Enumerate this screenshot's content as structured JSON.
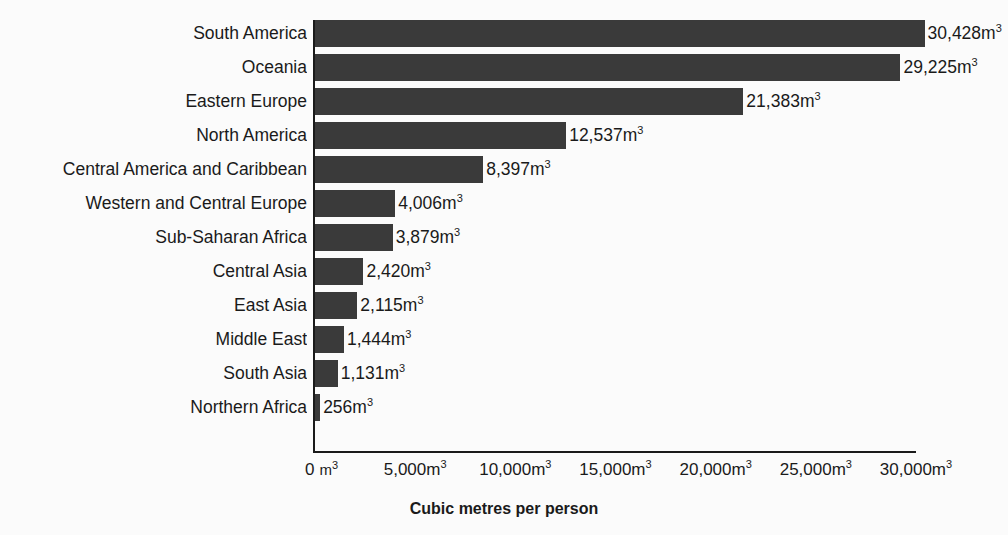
{
  "chart_data": {
    "type": "bar",
    "orientation": "horizontal",
    "title": "",
    "title_note": "chart title is cropped off the top edge of the screenshot and is not legible",
    "xlabel": "Cubic metres per person",
    "ylabel": "",
    "unit_suffix": "m",
    "unit_exponent": "3",
    "categories": [
      "South America",
      "Oceania",
      "Eastern Europe",
      "North America",
      "Central America and Caribbean",
      "Western and Central Europe",
      "Sub-Saharan Africa",
      "Central Asia",
      "East Asia",
      "Middle East",
      "South Asia",
      "Northern Africa"
    ],
    "values": [
      30428,
      29225,
      21383,
      12537,
      8397,
      4006,
      3879,
      2420,
      2115,
      1444,
      1131,
      256
    ],
    "value_labels": [
      "30,428m",
      "29,225m",
      "21,383m",
      "12,537m",
      "8,397m",
      "4,006m",
      "3,879m",
      "2,420m",
      "2,115m",
      "1,444m",
      "1,131m",
      "256m"
    ],
    "xlim": [
      0,
      30000
    ],
    "xticks": [
      0,
      5000,
      10000,
      15000,
      20000,
      25000,
      30000
    ],
    "xtick_labels": [
      "0",
      "5,000m",
      "10,000m",
      "15,000m",
      "20,000m",
      "25,000m",
      "30,000m"
    ],
    "zero_tick_unit": "m",
    "grid": false,
    "legend": null,
    "bar_color": "#3a3a3a",
    "background_color": "#fbfbfb",
    "axis_color": "#1a1a1a"
  }
}
